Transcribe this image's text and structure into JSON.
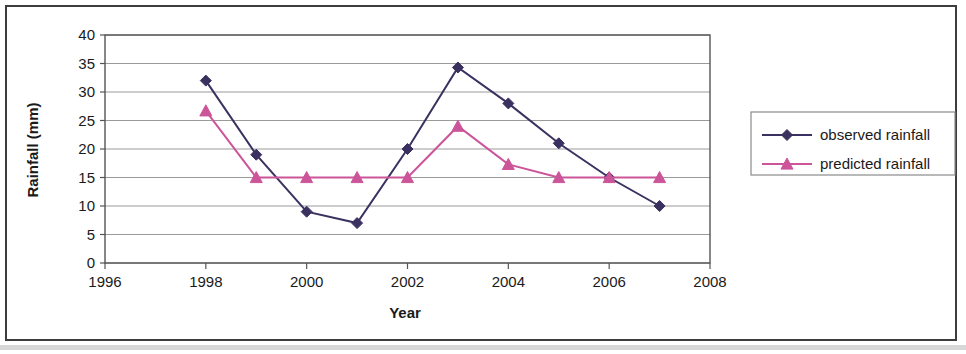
{
  "chart_data": {
    "type": "line",
    "title": "",
    "xlabel": "Year",
    "ylabel": "Rainfall (mm)",
    "xlim": [
      1996,
      2008
    ],
    "ylim": [
      0,
      40
    ],
    "xticks": [
      1996,
      1998,
      2000,
      2002,
      2004,
      2006,
      2008
    ],
    "yticks": [
      0,
      5,
      10,
      15,
      20,
      25,
      30,
      35,
      40
    ],
    "grid": "horizontal",
    "legend_position": "right",
    "x": [
      1998,
      1999,
      2000,
      2001,
      2002,
      2003,
      2004,
      2005,
      2006,
      2007
    ],
    "series": [
      {
        "name": "observed rainfall",
        "color": "#3b3160",
        "marker": "diamond",
        "values": [
          32,
          19,
          9,
          7,
          20,
          34.3,
          28,
          21,
          15,
          10
        ]
      },
      {
        "name": "predicted rainfall",
        "color": "#cc5599",
        "marker": "triangle",
        "values": [
          26.7,
          15,
          15,
          15,
          15,
          24,
          17.3,
          15,
          15,
          15
        ]
      }
    ]
  },
  "axis": {
    "y_title": "Rainfall (mm)",
    "x_title": "Year",
    "y_tick_labels": [
      "40",
      "35",
      "30",
      "25",
      "20",
      "15",
      "10",
      "5",
      "0"
    ],
    "x_tick_labels": [
      "1996",
      "1998",
      "2000",
      "2002",
      "2004",
      "2006",
      "2008"
    ]
  },
  "legend": {
    "entries": [
      {
        "label": "observed rainfall",
        "color": "#3b3160",
        "marker": "diamond"
      },
      {
        "label": "predicted rainfall",
        "color": "#cc5599",
        "marker": "triangle"
      }
    ]
  },
  "colors": {
    "observed": "#3b3160",
    "predicted": "#cc5599",
    "grid": "#9a9a9a",
    "axis": "#555555",
    "frame": "#3d3d3d",
    "text": "#1a1a1a"
  }
}
